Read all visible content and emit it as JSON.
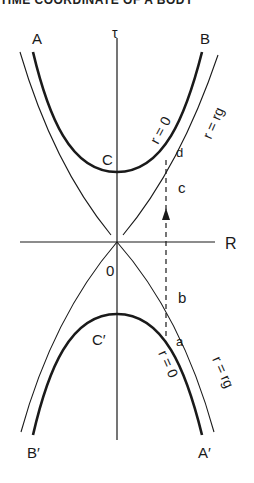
{
  "header": {
    "partial_text": "TIME COORDINATE OF A BODY"
  },
  "diagram": {
    "axes": {
      "vertical_label": "τ",
      "horizontal_label": "R",
      "origin_label": "0"
    },
    "points": {
      "A": "A",
      "B": "B",
      "C": "C",
      "C_prime": "C′",
      "A_prime": "A′",
      "B_prime": "B′"
    },
    "curve_labels": {
      "upper_singularity": "r = 0",
      "upper_horizon": "r = rg",
      "lower_singularity": "r = 0",
      "lower_horizon": "r = rg"
    },
    "worldline_points": {
      "a": "a",
      "b": "b",
      "c": "c",
      "d": "d"
    },
    "colors": {
      "ink": "#1a1a1a",
      "background": "#ffffff"
    }
  }
}
